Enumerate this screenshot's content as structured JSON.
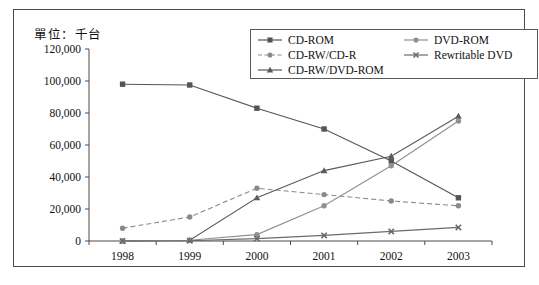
{
  "unit_title": "單位：千台",
  "legend": {
    "columns": [
      {
        "items": [
          {
            "label": "CD-ROM",
            "marker": "square",
            "dash": "solid",
            "color": "#555555"
          },
          {
            "label": "CD-RW/CD-R",
            "marker": "circle",
            "dash": "dashed",
            "color": "#8a8a8a"
          },
          {
            "label": "CD-RW/DVD-ROM",
            "marker": "triangle",
            "dash": "solid",
            "color": "#5a5a5a"
          }
        ]
      },
      {
        "items": [
          {
            "label": "DVD-ROM",
            "marker": "circle",
            "dash": "solid",
            "color": "#909090"
          },
          {
            "label": "Rewritable DVD",
            "marker": "cross",
            "dash": "solid",
            "color": "#6a6a6a"
          }
        ]
      }
    ]
  },
  "chart_data": {
    "type": "line",
    "title": "單位：千台",
    "xlabel": "",
    "ylabel": "",
    "categories": [
      "1998",
      "1999",
      "2000",
      "2001",
      "2002",
      "2003"
    ],
    "x": [
      1998,
      1999,
      2000,
      2001,
      2002,
      2003
    ],
    "ylim": [
      0,
      120000
    ],
    "yticks": [
      0,
      20000,
      40000,
      60000,
      80000,
      100000,
      120000
    ],
    "ytick_labels": [
      "0",
      "20,000",
      "40,000",
      "60,000",
      "80,000",
      "100,000",
      "120,000"
    ],
    "xtick_labels": [
      "1998",
      "1999",
      "2000",
      "2001",
      "2002",
      "2003"
    ],
    "grid": false,
    "legend_position": "top-right",
    "series": [
      {
        "name": "CD-ROM",
        "marker": "square",
        "dash": "solid",
        "color": "#555555",
        "values": [
          98000,
          97500,
          83000,
          70000,
          50000,
          27000
        ]
      },
      {
        "name": "CD-RW/CD-R",
        "marker": "circle",
        "dash": "dashed",
        "color": "#8a8a8a",
        "values": [
          8000,
          15000,
          33000,
          29000,
          25000,
          22000
        ]
      },
      {
        "name": "CD-RW/DVD-ROM",
        "marker": "triangle",
        "dash": "solid",
        "color": "#5a5a5a",
        "values": [
          0,
          500,
          27000,
          44000,
          53000,
          78000
        ]
      },
      {
        "name": "DVD-ROM",
        "marker": "circle",
        "dash": "solid",
        "color": "#909090",
        "values": [
          0,
          500,
          4000,
          22000,
          47000,
          75000
        ]
      },
      {
        "name": "Rewritable DVD",
        "marker": "cross",
        "dash": "solid",
        "color": "#6a6a6a",
        "values": [
          0,
          200,
          1500,
          3500,
          6000,
          8500
        ]
      }
    ]
  }
}
